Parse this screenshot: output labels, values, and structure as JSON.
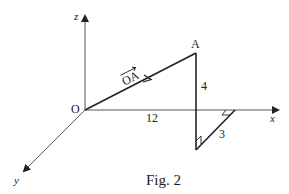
{
  "figure": {
    "caption": "Fig. 2",
    "axes": {
      "x_label": "x",
      "y_label": "y",
      "z_label": "z",
      "origin_label": "O"
    },
    "points": {
      "A_label": "A"
    },
    "vector": {
      "label": "OA",
      "from": "O",
      "to": "A"
    },
    "dimensions": {
      "along_x": "12",
      "vertical_z": "4",
      "along_y": "3"
    },
    "colors": {
      "line": "#222222",
      "axis": "#555555",
      "background": "#ffffff"
    }
  }
}
